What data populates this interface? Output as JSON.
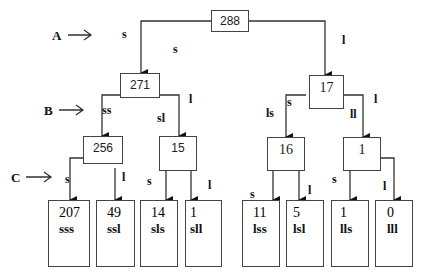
{
  "levels": [
    {
      "id": "A",
      "label": "A"
    },
    {
      "id": "B",
      "label": "B"
    },
    {
      "id": "C",
      "label": "C"
    }
  ],
  "root": {
    "value": "288"
  },
  "level_b": [
    {
      "value": "271"
    },
    {
      "value": "17"
    }
  ],
  "level_c": [
    {
      "value": "256"
    },
    {
      "value": "15"
    },
    {
      "value": "16"
    },
    {
      "value": "1"
    }
  ],
  "leaves": [
    {
      "value": "207",
      "code": "sss"
    },
    {
      "value": "49",
      "code": "ssl"
    },
    {
      "value": "14",
      "code": "sls"
    },
    {
      "value": "1",
      "code": "sll"
    },
    {
      "value": "11",
      "code": "lss"
    },
    {
      "value": "5",
      "code": "lsl"
    },
    {
      "value": "1",
      "code": "lls"
    },
    {
      "value": "0",
      "code": "lll"
    }
  ],
  "edge_labels": {
    "root_s_top": "s",
    "root_s_mid": "s",
    "root_l": "l",
    "n271_ss": "ss",
    "n271_sl": "sl",
    "n271_l": "l",
    "n17_s": "s",
    "n17_ls": "ls",
    "n17_ll": "ll",
    "n17_l": "l",
    "n256_s": "s",
    "n256_l": "l",
    "n15_s": "s",
    "n15_l": "l",
    "n16_s": "s",
    "n16_l": "l",
    "n1_s": "s",
    "n1_l": "l"
  }
}
